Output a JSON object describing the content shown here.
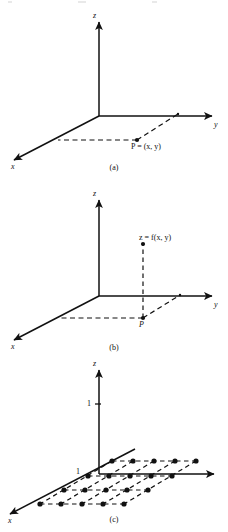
{
  "figure": {
    "title_text": "",
    "stroke_color": "#111111",
    "background_color": "#ffffff",
    "panels": [
      {
        "id": "a",
        "caption": "(a)",
        "axis_labels": {
          "x": "x",
          "y": "y",
          "z": "z"
        },
        "point_labels": [
          {
            "name": "point-p-label",
            "text_parts": {
              "p": "P",
              "eq": " = (",
              "x": "x",
              "comma": ", ",
              "y": "y",
              "close": ")"
            },
            "text": "P = (x, y)"
          }
        ],
        "tick_labels": [],
        "dots": 1,
        "description_dash_lines": 2
      },
      {
        "id": "b",
        "caption": "(b)",
        "axis_labels": {
          "x": "x",
          "y": "y",
          "z": "z"
        },
        "point_labels": [
          {
            "name": "function-value-label",
            "text": "z = f(x, y)"
          },
          {
            "name": "point-p-label",
            "text": "P"
          }
        ],
        "tick_labels": [],
        "dots": 2,
        "description_dash_lines": 3
      },
      {
        "id": "c",
        "caption": "(c)",
        "axis_labels": {
          "x": "x",
          "y": "",
          "z": "z"
        },
        "point_labels": [],
        "tick_labels": [
          {
            "name": "z-axis-tick-one",
            "text": "1"
          },
          {
            "name": "x-axis-tick-one",
            "text": "1"
          }
        ],
        "lattice": {
          "rows": 4,
          "cols": 5,
          "total_dots": 20,
          "plane": "xy"
        }
      }
    ]
  }
}
